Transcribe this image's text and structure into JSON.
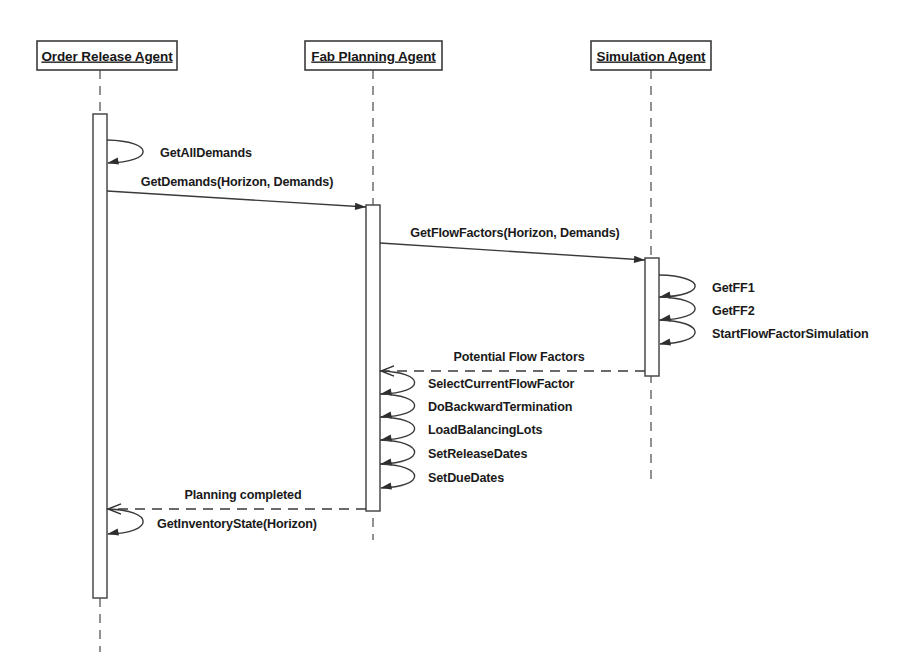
{
  "diagram": {
    "type": "uml-sequence-diagram",
    "title": "",
    "background_color": "#ffffff",
    "line_color": "#3a3a3a",
    "text_color": "#1a1a1a",
    "width": 910,
    "height": 666
  },
  "lifelines": [
    {
      "id": "order-release-agent",
      "label": "Order Release Agent",
      "box": {
        "x": 37,
        "y": 41,
        "width": 140,
        "height": 29
      },
      "axis_x": 100,
      "dash_top": 70,
      "dash_bottom": 652,
      "activation": {
        "x": 93,
        "y": 114,
        "width": 14,
        "height": 484
      }
    },
    {
      "id": "fab-planning-agent",
      "label": "Fab Planning Agent",
      "box": {
        "x": 305,
        "y": 41,
        "width": 137,
        "height": 29
      },
      "axis_x": 373,
      "dash_top": 70,
      "dash_bottom": 540,
      "activation": {
        "x": 366,
        "y": 205,
        "width": 14,
        "height": 306
      }
    },
    {
      "id": "simulation-agent",
      "label": "Simulation Agent",
      "box": {
        "x": 591,
        "y": 41,
        "width": 120,
        "height": 29
      },
      "axis_x": 651,
      "dash_top": 70,
      "dash_bottom": 484,
      "activation": {
        "x": 645,
        "y": 258,
        "width": 14,
        "height": 118
      }
    }
  ],
  "messages": [
    {
      "id": "msg-get-all-demands",
      "label": "GetAllDemands",
      "kind": "self",
      "style": "solid",
      "from": "order-release-agent",
      "to": "order-release-agent",
      "x": 107,
      "y_start": 140,
      "y_end": 163,
      "loop_width": 48,
      "label_x": 160,
      "label_y": 157
    },
    {
      "id": "msg-get-demands",
      "label": "GetDemands(Horizon, Demands)",
      "kind": "call",
      "style": "solid",
      "from": "order-release-agent",
      "to": "fab-planning-agent",
      "x_start": 107,
      "y_start": 191,
      "x_end": 366,
      "y_end": 207,
      "label_x": 237,
      "label_y": 186
    },
    {
      "id": "msg-get-flow-factors",
      "label": "GetFlowFactors(Horizon, Demands)",
      "kind": "call",
      "style": "solid",
      "from": "fab-planning-agent",
      "to": "simulation-agent",
      "x_start": 380,
      "y_start": 243,
      "x_end": 645,
      "y_end": 260,
      "label_x": 515,
      "label_y": 237
    },
    {
      "id": "msg-get-ff1",
      "label": "GetFF1",
      "kind": "self",
      "style": "solid",
      "from": "simulation-agent",
      "to": "simulation-agent",
      "x": 659,
      "y_start": 275,
      "y_end": 297,
      "loop_width": 48,
      "label_x": 712,
      "label_y": 292
    },
    {
      "id": "msg-get-ff2",
      "label": "GetFF2",
      "kind": "self",
      "style": "solid",
      "from": "simulation-agent",
      "to": "simulation-agent",
      "x": 659,
      "y_start": 297,
      "y_end": 320,
      "loop_width": 48,
      "label_x": 712,
      "label_y": 315
    },
    {
      "id": "msg-start-flow-factor-simulation",
      "label": "StartFlowFactorSimulation",
      "kind": "self",
      "style": "solid",
      "from": "simulation-agent",
      "to": "simulation-agent",
      "x": 659,
      "y_start": 320,
      "y_end": 344,
      "loop_width": 48,
      "label_x": 712,
      "label_y": 338
    },
    {
      "id": "msg-potential-flow-factors",
      "label": "Potential Flow Factors",
      "kind": "return",
      "style": "dashed",
      "from": "simulation-agent",
      "to": "fab-planning-agent",
      "x_start": 645,
      "y_start": 371,
      "x_end": 381,
      "y_end": 371,
      "label_x": 519,
      "label_y": 361
    },
    {
      "id": "msg-select-current-flow-factor",
      "label": "SelectCurrentFlowFactor",
      "kind": "self",
      "style": "solid",
      "from": "fab-planning-agent",
      "to": "fab-planning-agent",
      "x": 380,
      "y_start": 371,
      "y_end": 394,
      "loop_width": 46,
      "label_x": 428,
      "label_y": 388
    },
    {
      "id": "msg-do-backward-termination",
      "label": "DoBackwardTermination",
      "kind": "self",
      "style": "solid",
      "from": "fab-planning-agent",
      "to": "fab-planning-agent",
      "x": 380,
      "y_start": 394,
      "y_end": 417,
      "loop_width": 46,
      "label_x": 428,
      "label_y": 411
    },
    {
      "id": "msg-load-balancing-lots",
      "label": "LoadBalancingLots",
      "kind": "self",
      "style": "solid",
      "from": "fab-planning-agent",
      "to": "fab-planning-agent",
      "x": 380,
      "y_start": 417,
      "y_end": 440,
      "loop_width": 46,
      "label_x": 428,
      "label_y": 434
    },
    {
      "id": "msg-set-release-dates",
      "label": "SetReleaseDates",
      "kind": "self",
      "style": "solid",
      "from": "fab-planning-agent",
      "to": "fab-planning-agent",
      "x": 380,
      "y_start": 440,
      "y_end": 464,
      "loop_width": 46,
      "label_x": 428,
      "label_y": 458
    },
    {
      "id": "msg-set-due-dates",
      "label": "SetDueDates",
      "kind": "self",
      "style": "solid",
      "from": "fab-planning-agent",
      "to": "fab-planning-agent",
      "x": 380,
      "y_start": 464,
      "y_end": 488,
      "loop_width": 46,
      "label_x": 428,
      "label_y": 482
    },
    {
      "id": "msg-planning-completed",
      "label": "Planning completed",
      "kind": "return",
      "style": "dashed",
      "from": "fab-planning-agent",
      "to": "order-release-agent",
      "x_start": 366,
      "y_start": 509,
      "x_end": 108,
      "y_end": 509,
      "label_x": 243,
      "label_y": 499
    },
    {
      "id": "msg-get-inventory-state",
      "label": "GetInventoryState(Horizon)",
      "kind": "self",
      "style": "solid",
      "from": "order-release-agent",
      "to": "order-release-agent",
      "x": 107,
      "y_start": 509,
      "y_end": 534,
      "loop_width": 48,
      "label_x": 157,
      "label_y": 528
    }
  ]
}
